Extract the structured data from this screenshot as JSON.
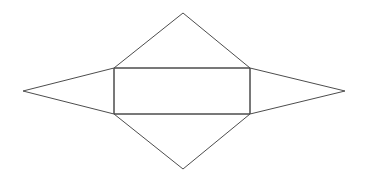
{
  "canvas": {
    "width": 369,
    "height": 181,
    "background_color": "#ffffff"
  },
  "diagram": {
    "name": "net-of-rectangular-bipyramid",
    "stroke_color": "#4d4d4d",
    "stroke_width": 1,
    "fill": "none"
  },
  "chart_data": {
    "type": "diagram",
    "title": "",
    "xlabel": "",
    "ylabel": "",
    "grid": false,
    "legend": "none",
    "xlim": [
      0,
      369
    ],
    "ylim": [
      0,
      181
    ],
    "vertices": {
      "rect_top_left": [
        114,
        68
      ],
      "rect_top_right": [
        250,
        68
      ],
      "rect_bottom_right": [
        250,
        114
      ],
      "rect_bottom_left": [
        114,
        114
      ],
      "top_apex": [
        183,
        13
      ],
      "bottom_apex": [
        183,
        169
      ],
      "left_apex": [
        23,
        91
      ],
      "right_apex": [
        345,
        91
      ]
    },
    "shapes": [
      {
        "name": "center-rectangle",
        "kind": "rectangle",
        "points": "114,68 250,68 250,114 114,114",
        "width": 136,
        "height": 46
      },
      {
        "name": "top-triangle",
        "kind": "triangle",
        "points": "114,68 250,68 183,13",
        "base": 136,
        "height": 55
      },
      {
        "name": "bottom-triangle",
        "kind": "triangle",
        "points": "114,114 250,114 183,169",
        "base": 136,
        "height": 55
      },
      {
        "name": "left-triangle",
        "kind": "triangle",
        "points": "114,68 114,114 23,91",
        "base": 46,
        "height": 91
      },
      {
        "name": "right-triangle",
        "kind": "triangle",
        "points": "250,68 250,114 345,91",
        "base": 46,
        "height": 95
      }
    ]
  }
}
